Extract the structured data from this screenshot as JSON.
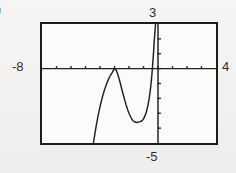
{
  "figure": {
    "problem_label": ")",
    "background_color": "#f3f2f0",
    "frame_color": "#1d1d1d",
    "curve_color": "#222222"
  },
  "labels": {
    "xmin": "-8",
    "xmax": "4",
    "ymax": "3",
    "ymin": "-5"
  },
  "chart_data": {
    "type": "line",
    "title": "",
    "xlabel": "",
    "ylabel": "",
    "xlim": [
      -8,
      4
    ],
    "ylim": [
      -5,
      3
    ],
    "grid": false,
    "legend": null,
    "axes": {
      "x_axis_visible": true,
      "y_axis_visible": true,
      "x_axis_at_y": 0,
      "y_axis_at_x": 0,
      "xtick_spacing": 1,
      "ytick_spacing": 1,
      "xticks": [
        -8,
        -7,
        -6,
        -5,
        -4,
        -3,
        -2,
        -1,
        0,
        1,
        2,
        3,
        4
      ],
      "yticks": [
        -5,
        -4,
        -3,
        -2,
        -1,
        0,
        1,
        2,
        3
      ]
    },
    "annotations": [
      {
        "text": "-8",
        "position": "left-of-frame",
        "meaning": "Xmin"
      },
      {
        "text": "4",
        "position": "right-of-frame",
        "meaning": "Xmax"
      },
      {
        "text": "3",
        "position": "above-frame",
        "meaning": "Ymax"
      },
      {
        "text": "-5",
        "position": "below-frame",
        "meaning": "Ymin"
      }
    ],
    "features": {
      "local_maximum": {
        "x": -3.0,
        "y": 0.0
      },
      "local_minimum": {
        "x": -1.2,
        "y": -3.6
      },
      "vertical_asymptote_x": -0.15,
      "left_branch_enters_bottom_at_x": -4.45
    },
    "series": [
      {
        "name": "y",
        "x": [
          -4.45,
          -4.35,
          -4.25,
          -4.15,
          -4.05,
          -3.95,
          -3.85,
          -3.75,
          -3.65,
          -3.55,
          -3.45,
          -3.35,
          -3.25,
          -3.15,
          -3.05,
          -3.0,
          -2.9,
          -2.8,
          -2.7,
          -2.6,
          -2.5,
          -2.4,
          -2.3,
          -2.2,
          -2.1,
          -2.0,
          -1.9,
          -1.8,
          -1.7,
          -1.6,
          -1.5,
          -1.4,
          -1.3,
          -1.2,
          -1.1,
          -1.0,
          -0.9,
          -0.8,
          -0.7,
          -0.6,
          -0.55,
          -0.5,
          -0.45,
          -0.4,
          -0.35,
          -0.3,
          -0.27,
          -0.24,
          -0.21,
          -0.19,
          -0.17
        ],
        "y": [
          -5.0,
          -4.35,
          -3.78,
          -3.26,
          -2.79,
          -2.36,
          -1.97,
          -1.62,
          -1.31,
          -1.03,
          -0.79,
          -0.58,
          -0.41,
          -0.25,
          -0.07,
          0.0,
          -0.08,
          -0.3,
          -0.62,
          -0.98,
          -1.36,
          -1.74,
          -2.1,
          -2.44,
          -2.74,
          -3.0,
          -3.22,
          -3.4,
          -3.52,
          -3.59,
          -3.62,
          -3.61,
          -3.58,
          -3.56,
          -3.5,
          -3.38,
          -3.18,
          -2.9,
          -2.5,
          -1.95,
          -1.6,
          -1.2,
          -0.72,
          -0.15,
          0.5,
          1.2,
          1.7,
          2.1,
          2.5,
          2.75,
          3.0
        ]
      }
    ]
  }
}
